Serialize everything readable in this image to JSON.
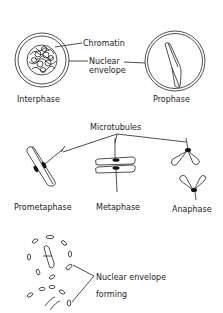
{
  "diagram": {
    "stages": [
      {
        "id": "interphase",
        "label": "Interphase"
      },
      {
        "id": "prophase",
        "label": "Prophase"
      },
      {
        "id": "prometaphase",
        "label": "Prometaphase"
      },
      {
        "id": "metaphase",
        "label": "Metaphase"
      },
      {
        "id": "anaphase",
        "label": "Anaphase"
      }
    ],
    "callouts": {
      "chromatin": "Chromatin",
      "nuclear_envelope_line1": "Nuclear",
      "nuclear_envelope_line2": "envelope",
      "microtubules": "Microtubules",
      "forming_line1": "Nuclear envelope",
      "forming_line2": "forming"
    },
    "colors": {
      "ink": "#222222",
      "background": "#ffffff"
    }
  }
}
